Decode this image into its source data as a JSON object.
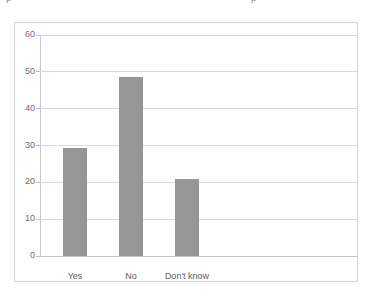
{
  "page": {
    "background_color": "#ffffff",
    "clipped_top_text": {
      "fragment_left": "ρ",
      "fragment_right": "ρ"
    }
  },
  "chart_frame": {
    "border_color": "#d2d2d2",
    "background_color": "#ffffff"
  },
  "chart_data": {
    "type": "bar",
    "title": "",
    "subtitle": "",
    "xlabel": "",
    "ylabel": "",
    "categories": [
      "Yes",
      "No",
      "Don't know"
    ],
    "values": [
      29.3,
      48.6,
      21.0
    ],
    "series": [
      {
        "name": "Responses",
        "values": [
          29.3,
          48.6,
          21.0
        ]
      }
    ],
    "ylim": [
      0,
      60
    ],
    "ytick_labels": [
      "0",
      "10",
      "20",
      "30",
      "40",
      "50",
      "60"
    ],
    "ytick_values": [
      0,
      10,
      20,
      30,
      40,
      50,
      60
    ],
    "grid": true,
    "grid_axis": "y",
    "grid_color": "#d9d9d9",
    "legend": false,
    "legend_position": "none",
    "bar_color": "#969696",
    "axis_color": "#c2c2c2",
    "tick_label_color": "#6d6d6d",
    "category_label_color": "#5d5d5d"
  }
}
